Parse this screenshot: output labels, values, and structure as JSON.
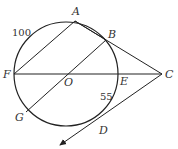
{
  "diagram": {
    "type": "geometry",
    "circle": {
      "center": "O",
      "cx": 66,
      "cy": 74,
      "r": 52
    },
    "points": {
      "A": {
        "label": "A",
        "x": 75,
        "y": 21
      },
      "B": {
        "label": "B",
        "x": 106,
        "y": 40
      },
      "C": {
        "label": "C",
        "x": 162,
        "y": 74
      },
      "D": {
        "label": "D",
        "x": 102,
        "y": 124
      },
      "E": {
        "label": "E",
        "x": 118,
        "y": 74
      },
      "F": {
        "label": "F",
        "x": 14,
        "y": 74
      },
      "G": {
        "label": "G",
        "x": 26,
        "y": 112
      },
      "O": {
        "label": "O",
        "x": 66,
        "y": 74
      }
    },
    "arc_labels": {
      "arc_FA": "100",
      "arc_ED": "55"
    },
    "colors": {
      "stroke": "#222222",
      "text": "#333333"
    }
  }
}
